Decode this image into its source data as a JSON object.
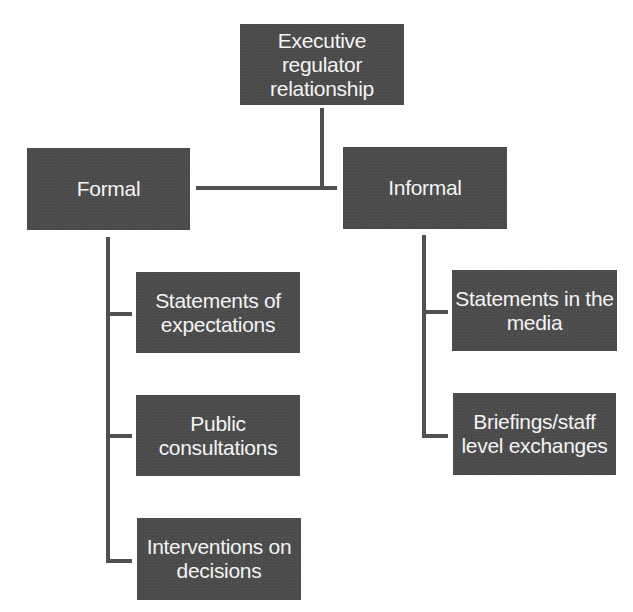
{
  "diagram": {
    "type": "hierarchy",
    "root": {
      "label": "Executive\nregulator\nrelationship"
    },
    "branches": [
      {
        "label": "Formal",
        "children": [
          {
            "label": "Statements of\nexpectations"
          },
          {
            "label": "Public\nconsultations"
          },
          {
            "label": "Interventions on\ndecisions"
          }
        ]
      },
      {
        "label": "Informal",
        "children": [
          {
            "label": "Statements in the\nmedia"
          },
          {
            "label": "Briefings/staff\nlevel exchanges"
          }
        ]
      }
    ],
    "colors": {
      "box_fill": "#4b4b4b",
      "box_text": "#f4f4f4",
      "connector": "#505050",
      "background": "#ffffff"
    }
  }
}
